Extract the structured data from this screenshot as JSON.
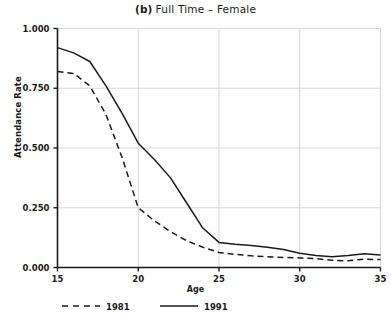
{
  "chart_data": {
    "type": "line",
    "title_bold_part": "(b)",
    "title_plain_part": "Full Time – Female",
    "xlabel": "Age",
    "ylabel": "Attendance Rate",
    "xlim": [
      15,
      35
    ],
    "ylim": [
      0.0,
      1.0
    ],
    "xticks": [
      15,
      20,
      25,
      30,
      35
    ],
    "xtick_labels": [
      "15",
      "20",
      "25",
      "30",
      "35"
    ],
    "yticks": [
      0.0,
      0.25,
      0.5,
      0.75,
      1.0
    ],
    "ytick_labels": [
      "0.000",
      "0.250",
      "0.500",
      "0.750",
      "1.000"
    ],
    "grid": true,
    "grid_color": "#d9d9d9",
    "axis_color": "#1a1a1a",
    "line_color": "#1a1a1a",
    "legend_position": "below-axes",
    "x": [
      15,
      16,
      17,
      18,
      19,
      20,
      21,
      22,
      23,
      24,
      25,
      26,
      27,
      28,
      29,
      30,
      31,
      32,
      33,
      34,
      35
    ],
    "series": [
      {
        "name": "1981",
        "style": "dashed",
        "values": [
          0.82,
          0.812,
          0.76,
          0.64,
          0.46,
          0.25,
          0.195,
          0.15,
          0.112,
          0.085,
          0.063,
          0.055,
          0.049,
          0.045,
          0.042,
          0.04,
          0.037,
          0.03,
          0.028,
          0.035,
          0.033
        ]
      },
      {
        "name": "1991",
        "style": "solid",
        "values": [
          0.92,
          0.898,
          0.862,
          0.76,
          0.645,
          0.52,
          0.452,
          0.375,
          0.27,
          0.165,
          0.105,
          0.097,
          0.092,
          0.085,
          0.075,
          0.06,
          0.05,
          0.045,
          0.05,
          0.058,
          0.052
        ]
      }
    ],
    "legend": [
      {
        "label": "1981",
        "style": "dashed"
      },
      {
        "label": "1991",
        "style": "solid"
      }
    ]
  }
}
